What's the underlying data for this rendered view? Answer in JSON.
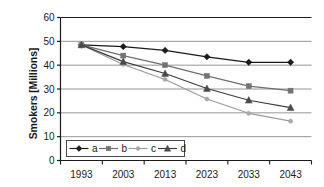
{
  "chart_data": {
    "type": "line",
    "title": "",
    "xlabel": "",
    "ylabel": "Smokers [Millions]",
    "categories": [
      "1993",
      "2003",
      "2013",
      "2023",
      "2033",
      "2043"
    ],
    "x": [
      1993,
      2003,
      2013,
      2023,
      2033,
      2043
    ],
    "xlim": [
      1988,
      2048
    ],
    "ylim": [
      0,
      60
    ],
    "yticks": [
      0,
      10,
      20,
      30,
      40,
      50,
      60
    ],
    "ytick_labels": [
      "0",
      "10",
      "20",
      "30",
      "40",
      "50",
      "60"
    ],
    "grid": true,
    "grid_axis": "y",
    "legend_position": "inside-bottom-left",
    "series": [
      {
        "name": "a",
        "marker": "diamond",
        "color": "#1a1a1a",
        "line_color": "#1a1a1a",
        "values": [
          48.5,
          47.8,
          46.2,
          43.5,
          41.2,
          41.2
        ]
      },
      {
        "name": "b",
        "marker": "square",
        "color": "#737373",
        "line_color": "#6e6e6e",
        "values": [
          48.5,
          44.0,
          40.0,
          35.5,
          31.2,
          29.3
        ]
      },
      {
        "name": "c",
        "marker": "dot",
        "color": "#a8a8a8",
        "line_color": "#9b9b9b",
        "values": [
          48.5,
          40.3,
          34.0,
          25.8,
          19.8,
          16.5
        ]
      },
      {
        "name": "d",
        "marker": "triangle",
        "color": "#4a4a4a",
        "line_color": "#3d3d3d",
        "values": [
          48.5,
          41.5,
          36.5,
          30.2,
          25.3,
          22.2
        ]
      }
    ]
  },
  "axes": {
    "y_title": "Smokers [Millions]"
  },
  "legend": {
    "entries": [
      "a",
      "b",
      "c",
      "d"
    ]
  },
  "colors": {
    "axis": "#1c1c1c",
    "grid": "#8a8a8a",
    "background": "#ffffff",
    "series_a": "#1a1a1a",
    "series_b": "#737373",
    "series_c": "#a8a8a8",
    "series_d": "#4a4a4a"
  }
}
